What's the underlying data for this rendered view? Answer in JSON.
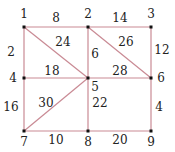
{
  "graph": {
    "edge_color": "#c98a94",
    "node_color": "#111111",
    "nodes": [
      {
        "id": "1",
        "x": 24,
        "y": 27,
        "lx": 24,
        "ly": 18
      },
      {
        "id": "2",
        "x": 88,
        "y": 27,
        "lx": 88,
        "ly": 18
      },
      {
        "id": "3",
        "x": 151,
        "y": 27,
        "lx": 151,
        "ly": 18
      },
      {
        "id": "4",
        "x": 24,
        "y": 78,
        "lx": 13,
        "ly": 82
      },
      {
        "id": "5",
        "x": 88,
        "y": 78,
        "lx": 95,
        "ly": 91
      },
      {
        "id": "6",
        "x": 151,
        "y": 78,
        "lx": 161,
        "ly": 82
      },
      {
        "id": "7",
        "x": 24,
        "y": 131,
        "lx": 24,
        "ly": 146
      },
      {
        "id": "8",
        "x": 88,
        "y": 131,
        "lx": 88,
        "ly": 146
      },
      {
        "id": "9",
        "x": 151,
        "y": 131,
        "lx": 151,
        "ly": 146
      }
    ],
    "edges": [
      {
        "from": "1",
        "to": "2",
        "w": "8",
        "lx": 56,
        "ly": 22
      },
      {
        "from": "2",
        "to": "3",
        "w": "14",
        "lx": 120,
        "ly": 22
      },
      {
        "from": "1",
        "to": "4",
        "w": "2",
        "lx": 11,
        "ly": 56
      },
      {
        "from": "1",
        "to": "5",
        "w": "24",
        "lx": 63,
        "ly": 46
      },
      {
        "from": "2",
        "to": "5",
        "w": "6",
        "lx": 95,
        "ly": 58
      },
      {
        "from": "2",
        "to": "6",
        "w": "26",
        "lx": 126,
        "ly": 46
      },
      {
        "from": "3",
        "to": "6",
        "w": "12",
        "lx": 162,
        "ly": 54
      },
      {
        "from": "4",
        "to": "5",
        "w": "18",
        "lx": 52,
        "ly": 75
      },
      {
        "from": "5",
        "to": "6",
        "w": "28",
        "lx": 120,
        "ly": 75
      },
      {
        "from": "4",
        "to": "7",
        "w": "16",
        "lx": 11,
        "ly": 111
      },
      {
        "from": "5",
        "to": "7",
        "w": "30",
        "lx": 46,
        "ly": 107
      },
      {
        "from": "5",
        "to": "8",
        "w": "22",
        "lx": 100,
        "ly": 107
      },
      {
        "from": "6",
        "to": "9",
        "w": "4",
        "lx": 159,
        "ly": 111
      },
      {
        "from": "7",
        "to": "8",
        "w": "10",
        "lx": 56,
        "ly": 144
      },
      {
        "from": "8",
        "to": "9",
        "w": "20",
        "lx": 120,
        "ly": 144
      }
    ]
  }
}
